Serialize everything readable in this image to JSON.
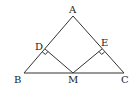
{
  "diagram": {
    "type": "geometry-triangle",
    "stroke_color": "#333333",
    "points": {
      "A": {
        "label": "A",
        "x": 73,
        "y": 16
      },
      "B": {
        "label": "B",
        "x": 24,
        "y": 73
      },
      "C": {
        "label": "C",
        "x": 124,
        "y": 73
      },
      "D": {
        "label": "D",
        "x": 45,
        "y": 49
      },
      "E": {
        "label": "E",
        "x": 102,
        "y": 49
      },
      "M": {
        "label": "M",
        "x": 73,
        "y": 73
      }
    },
    "segments": [
      "AB",
      "AC",
      "BC",
      "DM",
      "EM"
    ],
    "right_angles": [
      "MDA",
      "MEC"
    ]
  }
}
